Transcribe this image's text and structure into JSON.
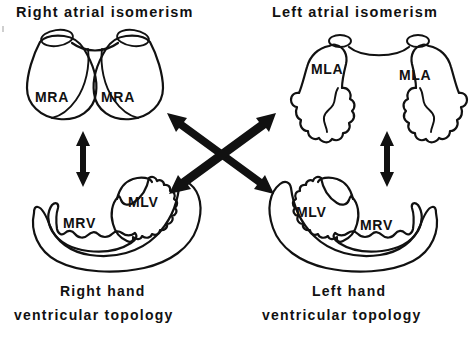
{
  "figure": {
    "title_left": "Right atrial isomerism",
    "title_right": "Left atrial isomerism",
    "caption_left_line1": "Right hand",
    "caption_left_line2": "ventricular topology",
    "caption_right_line1": "Left hand",
    "caption_right_line2": "ventricular  topology",
    "ink_color": "#111111",
    "background_color": "#ffffff"
  },
  "atria": {
    "right_isomerism": {
      "appendage_left_label": "MRA",
      "appendage_right_label": "MRA",
      "morphology": "broad triangular smooth-walled right atrial appendages"
    },
    "left_isomerism": {
      "appendage_left_label": "MLA",
      "appendage_right_label": "MLA",
      "morphology": "narrow crenellated finger-like left atrial appendages"
    }
  },
  "ventricles": {
    "right_hand_topology": {
      "left_chamber_label": "MRV",
      "right_chamber_label": "MLV"
    },
    "left_hand_topology": {
      "left_chamber_label": "MLV",
      "right_chamber_label": "MRV"
    }
  },
  "connectors": [
    {
      "name": "left-vertical",
      "type": "double-headed-arrow",
      "orientation": "vertical",
      "from": "right-atrial-isomerism",
      "to": "right-hand-ventricular-topology"
    },
    {
      "name": "right-vertical",
      "type": "double-headed-arrow",
      "orientation": "vertical",
      "from": "left-atrial-isomerism",
      "to": "left-hand-ventricular-topology"
    },
    {
      "name": "diagonal-down-right",
      "type": "double-headed-arrow",
      "orientation": "diagonal",
      "from": "right-atrial-isomerism",
      "to": "left-hand-ventricular-topology"
    },
    {
      "name": "diagonal-up-right",
      "type": "double-headed-arrow",
      "orientation": "diagonal",
      "from": "right-hand-ventricular-topology",
      "to": "left-atrial-isomerism"
    }
  ]
}
